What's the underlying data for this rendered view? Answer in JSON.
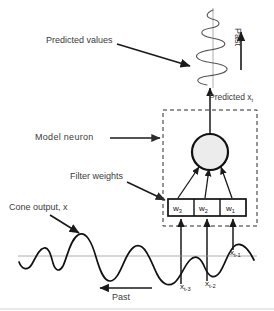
{
  "figure": {
    "background": "#ffffff",
    "line_color": "#1a1a1a",
    "label_color": "#3b3b3b",
    "neuron_fill": "#ececec",
    "baseline_color": "#9a9a9a",
    "dashed_box_color": "#2b2b2b"
  },
  "labels": {
    "predicted_values": "Predicted values",
    "predicted_xt": "Predicted x",
    "predicted_xt_sub": "t",
    "model_neuron": "Model  neuron",
    "filter_weights": "Filter weights",
    "cone_output": "Cone output, x",
    "past_bottom": "Past",
    "past_top": "Past"
  },
  "filter_weights": [
    {
      "name": "w",
      "sub": "3"
    },
    {
      "name": "w",
      "sub": "2"
    },
    {
      "name": "w",
      "sub": "1"
    }
  ],
  "input_samples": [
    {
      "name": "x",
      "sub": "t-3"
    },
    {
      "name": "x",
      "sub": "t-2"
    },
    {
      "name": "x",
      "sub": "t-1"
    }
  ]
}
